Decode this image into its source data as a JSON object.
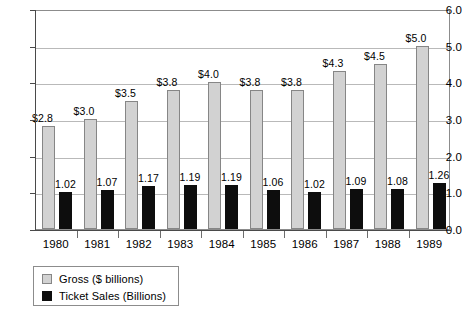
{
  "chart_data": {
    "type": "bar",
    "title": "",
    "subtitle": "",
    "xlabel": "",
    "ylabel": "",
    "ylim": [
      0.0,
      6.0
    ],
    "y_ticks": [
      "0.0",
      "1.0",
      "2.0",
      "3.0",
      "4.0",
      "5.0",
      "6.0"
    ],
    "grid": true,
    "legend_position": "below-left",
    "categories": [
      "1980",
      "1981",
      "1982",
      "1983",
      "1984",
      "1985",
      "1986",
      "1987",
      "1988",
      "1989"
    ],
    "series": [
      {
        "name": "Gross ($ billions)",
        "color": "#d2d2d2",
        "values": [
          2.8,
          3.0,
          3.5,
          3.8,
          4.0,
          3.8,
          3.8,
          4.3,
          4.5,
          5.0
        ],
        "labels": [
          "$2.8",
          "$3.0",
          "$3.5",
          "$3.8",
          "$4.0",
          "$3.8",
          "$3.8",
          "$4.3",
          "$4.5",
          "$5.0"
        ]
      },
      {
        "name": "Ticket Sales (Billions)",
        "color": "#0d0d0d",
        "values": [
          1.02,
          1.07,
          1.17,
          1.19,
          1.19,
          1.06,
          1.02,
          1.09,
          1.08,
          1.26
        ],
        "labels": [
          "1.02",
          "1.07",
          "1.17",
          "1.19",
          "1.19",
          "1.06",
          "1.02",
          "1.09",
          "1.08",
          "1.26"
        ]
      }
    ]
  },
  "legend": {
    "entries": [
      {
        "label": "Gross ($ billions)",
        "swatch": "gross"
      },
      {
        "label": "Ticket Sales (Billions)",
        "swatch": "tickets"
      }
    ]
  }
}
